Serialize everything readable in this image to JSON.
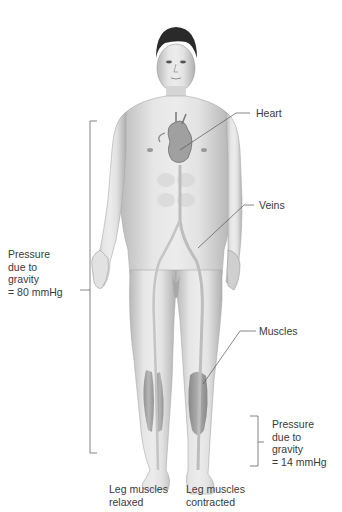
{
  "labels": {
    "heart": "Heart",
    "veins": "Veins",
    "muscles": "Muscles",
    "pressure_top": "Pressure\ndue to\ngravity\n= 80 mmHg",
    "pressure_bottom": "Pressure\ndue to\ngravity\n= 14 mmHg",
    "leg_relaxed": "Leg muscles\nrelaxed",
    "leg_contracted": "Leg muscles\ncontracted"
  },
  "colors": {
    "skin_light": "#e8e8e8",
    "skin_mid": "#c8c8c8",
    "skin_dark": "#9a9a9a",
    "hair": "#2a2a2a",
    "line": "#555555",
    "vein": "#bdbdbd",
    "muscle": "#8c8c8c"
  }
}
